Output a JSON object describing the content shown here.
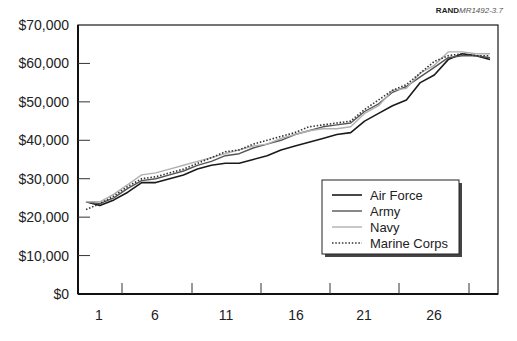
{
  "source_tag": {
    "org": "RAND",
    "id": "MR1492-3.7"
  },
  "chart_data": {
    "type": "line",
    "title": "",
    "xlabel": "",
    "ylabel": "",
    "ylim": [
      0,
      70000
    ],
    "xlim": [
      1,
      30
    ],
    "grid": false,
    "legend_position": "lower right (inside plot)",
    "y_ticks": [
      "$0",
      "$10,000",
      "$20,000",
      "$30,000",
      "$40,000",
      "$50,000",
      "$60,000",
      "$70,000"
    ],
    "y_tick_values": [
      0,
      10000,
      20000,
      30000,
      40000,
      50000,
      60000,
      70000
    ],
    "x_tick_labels": [
      "1",
      "6",
      "11",
      "16",
      "21",
      "26"
    ],
    "x": [
      1,
      2,
      3,
      4,
      5,
      6,
      7,
      8,
      9,
      10,
      11,
      12,
      13,
      14,
      15,
      16,
      17,
      18,
      19,
      20,
      21,
      22,
      23,
      24,
      25,
      26,
      27,
      28,
      29,
      30
    ],
    "series": [
      {
        "name": "Air Force",
        "style": "solid",
        "color": "#1a1a1a",
        "width": 1.6,
        "values": [
          24000,
          23000,
          24500,
          26500,
          29000,
          29000,
          30000,
          31000,
          32500,
          33500,
          34000,
          34000,
          35000,
          36000,
          37500,
          38500,
          39500,
          40500,
          41500,
          42000,
          45000,
          47000,
          49000,
          50500,
          55000,
          57000,
          61000,
          62500,
          62000,
          61000
        ]
      },
      {
        "name": "Army",
        "style": "solid",
        "color": "#555555",
        "width": 1.4,
        "values": [
          24000,
          23500,
          25000,
          27500,
          29500,
          30000,
          31000,
          32000,
          33500,
          34500,
          36000,
          36500,
          38000,
          39000,
          40000,
          41500,
          42500,
          43500,
          44000,
          44500,
          47500,
          49500,
          52500,
          54000,
          56500,
          59000,
          61500,
          62000,
          62000,
          61500
        ]
      },
      {
        "name": "Navy",
        "style": "solid",
        "color": "#b0b0b0",
        "width": 1.4,
        "values": [
          24000,
          24000,
          26000,
          28500,
          31000,
          31500,
          32500,
          33500,
          34500,
          35500,
          36500,
          37500,
          38500,
          39000,
          40500,
          41500,
          42500,
          43000,
          43000,
          43500,
          47000,
          49000,
          53000,
          53500,
          57500,
          59500,
          63000,
          63000,
          62500,
          62500
        ]
      },
      {
        "name": "Marine Corps",
        "style": "dotted",
        "color": "#333333",
        "width": 1.6,
        "values": [
          22000,
          23500,
          25500,
          28000,
          30000,
          30500,
          31500,
          32500,
          34000,
          35500,
          37000,
          37500,
          39000,
          40000,
          41000,
          42000,
          43500,
          44000,
          44500,
          45000,
          48000,
          50500,
          53000,
          54500,
          57500,
          60500,
          62000,
          62500,
          62000,
          62000
        ]
      }
    ]
  }
}
